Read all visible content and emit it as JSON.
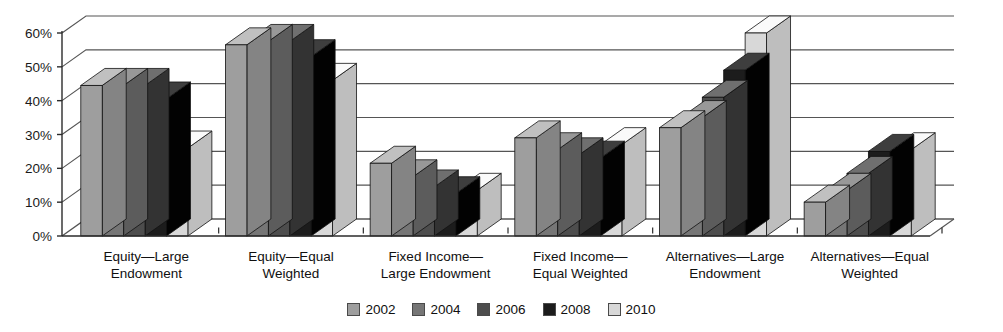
{
  "chart_data": {
    "type": "bar",
    "title": "",
    "subtitle": "",
    "xlabel": "",
    "ylabel": "",
    "ylim": [
      0,
      0.6
    ],
    "ytick_labels": [
      "0%",
      "10%",
      "20%",
      "30%",
      "40%",
      "50%",
      "60%"
    ],
    "ytick_values": [
      0,
      10,
      20,
      30,
      40,
      50,
      60
    ],
    "grid": true,
    "legend_position": "bottom",
    "style": "3d-bars",
    "categories": [
      "Equity—Large\nEndowment",
      "Equity—Equal\nWeighted",
      "Fixed Income—\nLarge Endowment",
      "Fixed Income—\nEqual Weighted",
      "Alternatives—Large\nEndowment",
      "Alternatives—Equal\nWeighted"
    ],
    "series": [
      {
        "name": "2002",
        "color": "#9e9e9e",
        "values": [
          44.5,
          56.5,
          21.5,
          29.0,
          32.0,
          10.0
        ]
      },
      {
        "name": "2004",
        "color": "#767676",
        "values": [
          44.5,
          57.5,
          17.5,
          25.5,
          35.0,
          13.5
        ]
      },
      {
        "name": "2006",
        "color": "#4d4d4d",
        "values": [
          44.5,
          57.5,
          14.5,
          24.0,
          41.0,
          18.5
        ]
      },
      {
        "name": "2008",
        "color": "#1c1c1c",
        "values": [
          40.5,
          53.0,
          12.5,
          23.0,
          49.0,
          25.0
        ]
      },
      {
        "name": "2010",
        "color": "#d8d8d8",
        "values": [
          26.0,
          46.0,
          13.5,
          27.0,
          60.0,
          25.5
        ]
      }
    ]
  },
  "legend": {
    "items": [
      {
        "label": "2002"
      },
      {
        "label": "2004"
      },
      {
        "label": "2006"
      },
      {
        "label": "2008"
      },
      {
        "label": "2010"
      }
    ]
  },
  "colors": {
    "axis": "#2b2b2b",
    "grid": "#555555",
    "background": "#ffffff",
    "bar_top_tint": "#ffffff",
    "bar_side_shade": "#000000"
  }
}
